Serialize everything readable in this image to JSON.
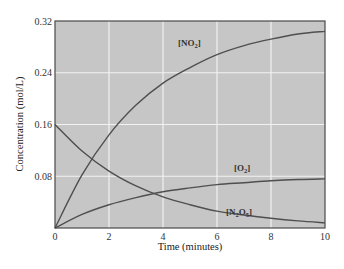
{
  "chart_data": {
    "type": "line",
    "title": "",
    "xlabel": "Time (minutes)",
    "ylabel": "Concentration (mol/L)",
    "xlim": [
      0,
      10
    ],
    "ylim": [
      0,
      0.32
    ],
    "x_ticks": [
      "0",
      "2",
      "4",
      "6",
      "8",
      "10"
    ],
    "y_ticks": [
      "0.08",
      "0.16",
      "0.24",
      "0.32"
    ],
    "grid": true,
    "legend": "inline labels",
    "x": [
      0,
      1,
      2,
      3,
      4,
      5,
      6,
      7,
      8,
      9,
      10
    ],
    "series": [
      {
        "name": "[NO2]",
        "label_main": "[NO",
        "label_sub": "2",
        "label_end": "]",
        "values": [
          0.0,
          0.041,
          0.072,
          0.095,
          0.112,
          0.124,
          0.134,
          0.141,
          0.146,
          0.15,
          0.152
        ]
      },
      {
        "name": "[O2]",
        "label_main": "[O",
        "label_sub": "2",
        "label_end": "]",
        "values": [
          0.0,
          0.021,
          0.036,
          0.047,
          0.056,
          0.062,
          0.067,
          0.07,
          0.073,
          0.075,
          0.076
        ]
      },
      {
        "name": "[N2O5]",
        "label_main": "[N",
        "label_sub": "2",
        "label_mid": "O",
        "label_sub2": "5",
        "label_end": "]",
        "values": [
          0.16,
          0.119,
          0.088,
          0.065,
          0.048,
          0.036,
          0.026,
          0.02,
          0.015,
          0.011,
          0.008
        ]
      }
    ],
    "colors": {
      "plot_bg": "#c6c6c6",
      "grid": "#f2f2f2",
      "curve": "#4f4f4f",
      "frame": "#4a4a4a"
    }
  }
}
